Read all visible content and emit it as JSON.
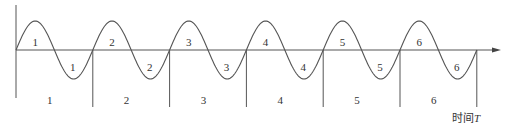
{
  "diagram": {
    "type": "periodic-waveform",
    "axis": {
      "x_label_prefix": "时间",
      "x_label_var": "T"
    },
    "cycles": [
      {
        "index": 1,
        "positive_half_label": "1",
        "negative_half_label": "1",
        "period_label": "1"
      },
      {
        "index": 2,
        "positive_half_label": "2",
        "negative_half_label": "2",
        "period_label": "2"
      },
      {
        "index": 3,
        "positive_half_label": "3",
        "negative_half_label": "3",
        "period_label": "3"
      },
      {
        "index": 4,
        "positive_half_label": "4",
        "negative_half_label": "4",
        "period_label": "4"
      },
      {
        "index": 5,
        "positive_half_label": "5",
        "negative_half_label": "5",
        "period_label": "5"
      },
      {
        "index": 6,
        "positive_half_label": "6",
        "negative_half_label": "6",
        "period_label": "6"
      }
    ],
    "colors": {
      "line": "#555555",
      "text": "#333333",
      "background": "#ffffff"
    }
  }
}
